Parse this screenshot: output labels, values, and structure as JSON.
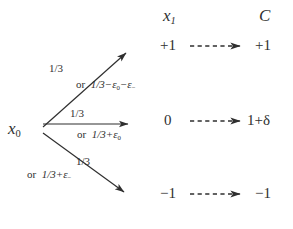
{
  "figure": {
    "type": "branching-probability-diagram",
    "background_color": "#ffffff",
    "ink_color": "#2f2f2f",
    "columns": {
      "state_header": "x",
      "state_header_sub": "1",
      "cost_header": "C"
    },
    "source": {
      "label": "x",
      "sub": "0"
    },
    "branches": [
      {
        "id": "up",
        "probability": "1/3",
        "alternative_prefix": "or",
        "alternative": "1/3−ε",
        "alternative_sub1": "0",
        "alternative_mid": "−ε",
        "alternative_sub2": "−",
        "target_state": "+1",
        "target_cost": "+1"
      },
      {
        "id": "straight",
        "probability": "1/3",
        "alternative_prefix": "or",
        "alternative": "1/3+ε",
        "alternative_sub1": "0",
        "alternative_mid": "",
        "alternative_sub2": "",
        "target_state": "0",
        "target_cost": "1+δ"
      },
      {
        "id": "down",
        "probability": "1/3",
        "alternative_prefix": "or",
        "alternative": "1/3+ε",
        "alternative_sub1": "−",
        "alternative_mid": "",
        "alternative_sub2": "",
        "target_state": "−1",
        "target_cost": "−1"
      }
    ],
    "states": {
      "plus_one": "+1",
      "zero": "0",
      "minus_one": "−1"
    },
    "costs": {
      "plus_one": "+1",
      "zero": "1+δ",
      "minus_one": "−1"
    }
  }
}
